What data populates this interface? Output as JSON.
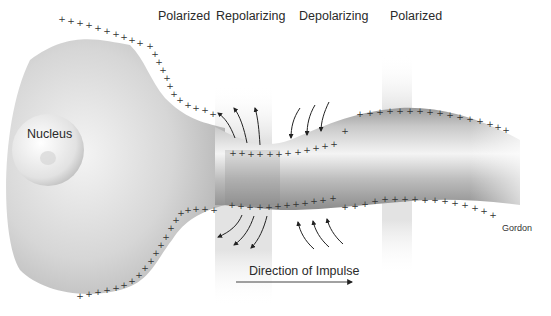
{
  "diagram": {
    "labels": {
      "nucleus": "Nucleus",
      "zone_1": "Polarized",
      "zone_2": "Repolarizing",
      "zone_3": "Depolarizing",
      "zone_4": "Polarized",
      "direction": "Direction of Impulse",
      "credit": "Gordon"
    },
    "charge_symbol": "+",
    "zones": [
      {
        "name": "Polarized",
        "x_range": [
          0,
          215
        ],
        "shaded": false
      },
      {
        "name": "Repolarizing",
        "x_range": [
          215,
          272
        ],
        "shaded": true,
        "arrows": "outward"
      },
      {
        "name": "Depolarizing",
        "x_range": [
          272,
          382
        ],
        "shaded": false,
        "arrows": "inward"
      },
      {
        "name": "Polarized",
        "x_range": [
          382,
          551
        ],
        "shaded": true
      }
    ],
    "colors": {
      "background": "#ffffff",
      "cell_body": "#bdbdbd",
      "axon_dark": "#8a8a8a",
      "text": "#2a2a2a",
      "charge": "#333333",
      "band": "#e6e6e6"
    }
  }
}
